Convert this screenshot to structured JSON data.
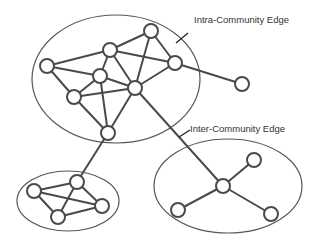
{
  "annotations": {
    "intra": {
      "label": "Intra-Community Edge",
      "x": 194,
      "y": 15,
      "pointer": [
        188,
        33,
        176,
        43
      ]
    },
    "inter": {
      "label": "Inter-Community Edge",
      "x": 190,
      "y": 124,
      "pointer": [
        190,
        130,
        179,
        137
      ]
    }
  },
  "communities": [
    {
      "id": "large",
      "cx": 116,
      "cy": 79,
      "rx": 84,
      "ry": 64
    },
    {
      "id": "small-left",
      "cx": 68,
      "cy": 201,
      "rx": 51,
      "ry": 30
    },
    {
      "id": "right",
      "cx": 228,
      "cy": 186,
      "rx": 74,
      "ry": 47
    }
  ],
  "nodes": [
    {
      "id": "A",
      "x": 47,
      "y": 66
    },
    {
      "id": "B",
      "x": 110,
      "y": 50
    },
    {
      "id": "C",
      "x": 151,
      "y": 31
    },
    {
      "id": "D",
      "x": 175,
      "y": 63
    },
    {
      "id": "E",
      "x": 100,
      "y": 76
    },
    {
      "id": "F",
      "x": 135,
      "y": 88
    },
    {
      "id": "G",
      "x": 74,
      "y": 97
    },
    {
      "id": "H",
      "x": 108,
      "y": 133
    },
    {
      "id": "I",
      "x": 242,
      "y": 84
    },
    {
      "id": "J",
      "x": 77,
      "y": 182
    },
    {
      "id": "K",
      "x": 34,
      "y": 191
    },
    {
      "id": "L",
      "x": 58,
      "y": 217
    },
    {
      "id": "M",
      "x": 102,
      "y": 206
    },
    {
      "id": "N",
      "x": 223,
      "y": 186
    },
    {
      "id": "O",
      "x": 254,
      "y": 160
    },
    {
      "id": "P",
      "x": 178,
      "y": 210
    },
    {
      "id": "Q",
      "x": 271,
      "y": 214
    }
  ],
  "edges": [
    [
      "A",
      "B"
    ],
    [
      "A",
      "E"
    ],
    [
      "A",
      "G"
    ],
    [
      "B",
      "C"
    ],
    [
      "B",
      "D"
    ],
    [
      "B",
      "E"
    ],
    [
      "B",
      "F"
    ],
    [
      "C",
      "D"
    ],
    [
      "C",
      "F"
    ],
    [
      "D",
      "F"
    ],
    [
      "D",
      "I"
    ],
    [
      "E",
      "G"
    ],
    [
      "E",
      "F"
    ],
    [
      "E",
      "H"
    ],
    [
      "G",
      "F"
    ],
    [
      "G",
      "H"
    ],
    [
      "F",
      "H"
    ],
    [
      "H",
      "J"
    ],
    [
      "F",
      "N"
    ],
    [
      "J",
      "K"
    ],
    [
      "J",
      "L"
    ],
    [
      "J",
      "M"
    ],
    [
      "K",
      "L"
    ],
    [
      "K",
      "M"
    ],
    [
      "L",
      "M"
    ],
    [
      "N",
      "O"
    ],
    [
      "N",
      "P"
    ],
    [
      "N",
      "Q"
    ]
  ],
  "node_radius": 7
}
